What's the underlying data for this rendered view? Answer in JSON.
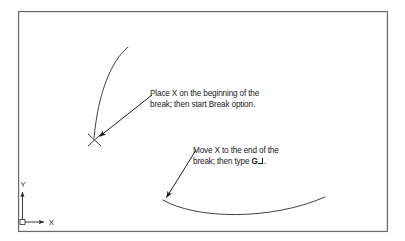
{
  "figure": {
    "kind": "cad-instructional-diagram",
    "background_color": "#ffffff",
    "frame": {
      "name": "drawing-area-border",
      "stroke_color": "#5a5a5a",
      "x": 18,
      "y": 11,
      "width": 370,
      "height": 221
    },
    "line_color": "#2b2b2b",
    "text_color": "#1b1b1b"
  },
  "annotations": [
    {
      "id": "annotation-1",
      "line1": "Place X on the beginning of the",
      "line2": "break; then start Break option."
    },
    {
      "id": "annotation-2",
      "line1": "Move X to the end of the",
      "line2_prefix": "break; then type ",
      "line2_key": "G",
      "line2_suffix": "."
    }
  ],
  "geometry": {
    "upper_arc": {
      "name": "upper-arc-entity",
      "description": "arc curving from upper right down to lower left ending at the X pick point"
    },
    "lower_arc": {
      "name": "lower-arc-entity",
      "description": "shallow concave-up arc across lower half of the drawing area"
    },
    "x_marker": {
      "name": "x-pick-marker",
      "x": 95,
      "y": 140
    },
    "leader_1": {
      "name": "leader-arrow-1",
      "from_x": 152,
      "from_y": 95,
      "to_x": 97,
      "to_y": 138
    },
    "leader_2": {
      "name": "leader-arrow-2",
      "from_x": 196,
      "from_y": 150,
      "to_x": 165,
      "to_y": 200
    }
  },
  "ucs_icon": {
    "name": "ucs-icon",
    "x_label": "X",
    "y_label": "Y",
    "origin_x": 22,
    "origin_y": 222
  }
}
